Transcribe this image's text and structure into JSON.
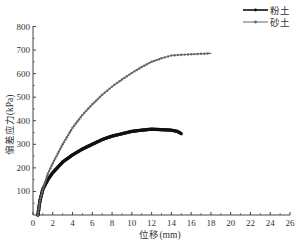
{
  "chart_data": {
    "type": "line",
    "title": "",
    "xlabel": "位移(mm)",
    "ylabel": "偏差应力(kPa)",
    "xlim": [
      0,
      26
    ],
    "ylim": [
      0,
      800
    ],
    "x_ticks": [
      0,
      2,
      4,
      6,
      8,
      10,
      12,
      14,
      16,
      18,
      20,
      22,
      24,
      26
    ],
    "y_ticks": [
      100,
      200,
      300,
      400,
      500,
      600,
      700,
      800
    ],
    "grid": false,
    "legend_position": "top-right",
    "series": [
      {
        "name": "粉土",
        "style": "thick-black-line",
        "color": "#111111",
        "x": [
          0.5,
          0.7,
          1.0,
          1.5,
          2.0,
          3.0,
          4.0,
          5.0,
          6.0,
          7.0,
          8.0,
          9.0,
          10.0,
          11.0,
          12.0,
          13.0,
          14.0,
          14.6,
          15.0
        ],
        "y": [
          0,
          60,
          110,
          150,
          180,
          225,
          255,
          280,
          300,
          320,
          335,
          345,
          355,
          360,
          364,
          362,
          360,
          355,
          345
        ]
      },
      {
        "name": "砂土",
        "style": "gray-line-with-markers",
        "color": "#666666",
        "x": [
          0.5,
          0.7,
          1.0,
          1.5,
          2.0,
          3.0,
          4.0,
          5.0,
          6.0,
          7.0,
          8.0,
          9.0,
          10.0,
          11.0,
          12.0,
          13.0,
          14.0,
          15.0,
          16.0,
          17.0,
          18.0
        ],
        "y": [
          0,
          60,
          110,
          175,
          220,
          300,
          370,
          425,
          470,
          510,
          545,
          575,
          603,
          628,
          650,
          665,
          677,
          680,
          682,
          684,
          686
        ]
      }
    ]
  },
  "legend": {
    "items": [
      {
        "label": "粉土"
      },
      {
        "label": "砂土"
      }
    ]
  },
  "axes": {
    "x_title": "位移(mm)",
    "y_title": "偏差应力(kPa)"
  }
}
